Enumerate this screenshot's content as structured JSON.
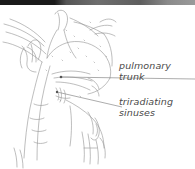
{
  "figure": {
    "type": "anatomical-line-drawing",
    "background_color": "#ffffff",
    "ink_color": "#555555",
    "top_band_color": "#1a1a1a"
  },
  "annotations": [
    {
      "id": "pulmonary-trunk",
      "line1": "pulmonary",
      "line2": "trunk",
      "leader": "horizontal line from structure to label",
      "color": "#4a4a4a"
    },
    {
      "id": "triradiating-sinuses",
      "line1": "triradiating",
      "line2": "sinuses",
      "leader": "diagonal line from structure to label",
      "color": "#4a4a4a"
    }
  ]
}
